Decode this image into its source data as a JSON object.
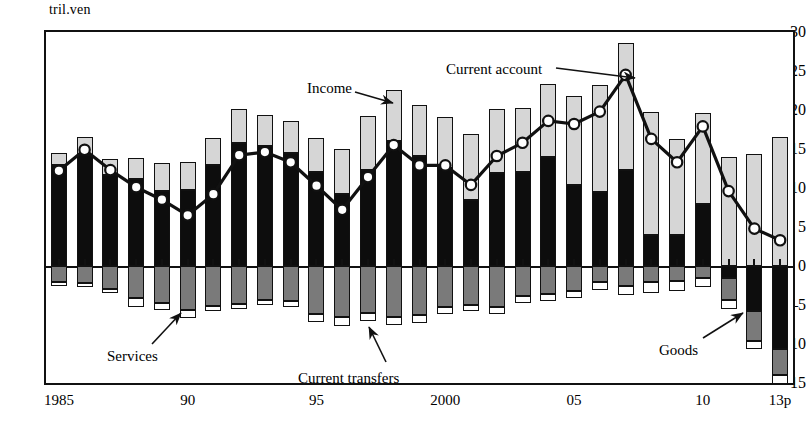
{
  "chart_data": {
    "type": "bar",
    "title": "",
    "subtitle": "",
    "xlabel": "",
    "ylabel": "tril.yen",
    "unit_label": "tril.ven",
    "stacked": true,
    "grid": false,
    "legend_position": "none",
    "ylim": [
      -15,
      30
    ],
    "y_ticks": [
      30,
      25,
      20,
      15,
      10,
      5,
      0,
      -5,
      -10,
      -15
    ],
    "x": [
      1985,
      1986,
      1987,
      1988,
      1989,
      1990,
      1991,
      1992,
      1993,
      1994,
      1995,
      1996,
      1997,
      1998,
      1999,
      2000,
      2001,
      2002,
      2003,
      2004,
      2005,
      2006,
      2007,
      2008,
      2009,
      2010,
      2011,
      2012,
      2013
    ],
    "x_tick_labels": [
      "1985",
      "90",
      "95",
      "2000",
      "05",
      "10",
      "13p"
    ],
    "x_tick_values": [
      1985,
      1990,
      1995,
      2000,
      2005,
      2010,
      2013
    ],
    "series": [
      {
        "name": "Goods",
        "color": "#0d0d0d",
        "values": [
          13.0,
          14.2,
          11.7,
          11.1,
          9.6,
          9.7,
          13.0,
          15.8,
          15.4,
          14.5,
          12.0,
          9.2,
          12.3,
          16.0,
          14.1,
          12.6,
          8.5,
          11.9,
          12.0,
          14.0,
          10.4,
          9.5,
          12.3,
          4.0,
          4.0,
          8.0,
          -1.6,
          -5.8,
          -10.6
        ]
      },
      {
        "name": "Income",
        "color": "#d6d6d6",
        "values": [
          1.5,
          2.4,
          2.0,
          2.7,
          3.6,
          3.6,
          3.4,
          4.3,
          4.0,
          4.1,
          4.4,
          5.8,
          6.9,
          6.6,
          6.5,
          6.5,
          8.4,
          8.2,
          8.3,
          9.3,
          11.4,
          13.7,
          16.3,
          15.8,
          12.3,
          11.6,
          14.0,
          14.3,
          16.5
        ]
      },
      {
        "name": "Services",
        "color": "#7a7a7a",
        "values": [
          -2.1,
          -2.2,
          -3.0,
          -4.1,
          -4.7,
          -5.6,
          -5.1,
          -4.9,
          -4.3,
          -4.5,
          -6.2,
          -6.6,
          -6.0,
          -6.6,
          -6.3,
          -5.3,
          -5.0,
          -5.3,
          -3.9,
          -3.6,
          -3.2,
          -2.1,
          -2.6,
          -2.1,
          -1.9,
          -1.6,
          -2.8,
          -3.8,
          -3.4
        ]
      },
      {
        "name": "Current transfers",
        "color": "#ffffff",
        "values": [
          -0.3,
          -0.3,
          -0.5,
          -1.1,
          -1.0,
          -1.1,
          -0.7,
          -0.6,
          -0.7,
          -0.7,
          -1.0,
          -1.1,
          -1.0,
          -1.0,
          -1.0,
          -0.9,
          -0.8,
          -0.8,
          -0.8,
          -0.9,
          -0.9,
          -1.0,
          -1.1,
          -1.3,
          -1.3,
          -1.1,
          -1.1,
          -1.1,
          -1.1
        ]
      }
    ],
    "line": {
      "name": "Current account",
      "marker": "open-circle",
      "color": "#111111",
      "values": [
        12.2,
        14.9,
        12.3,
        10.1,
        8.5,
        6.5,
        9.2,
        14.2,
        14.6,
        13.3,
        10.3,
        7.2,
        11.4,
        15.5,
        12.9,
        12.9,
        10.4,
        14.1,
        15.8,
        18.6,
        18.2,
        19.8,
        24.5,
        16.3,
        13.3,
        17.9,
        9.6,
        4.8,
        3.3
      ]
    },
    "annotations": [
      {
        "label": "Income",
        "x": 307,
        "y": 80,
        "arrow_from": [
          355,
          92
        ],
        "arrow_to": [
          393,
          103
        ]
      },
      {
        "label": "Current account",
        "x": 446,
        "y": 61,
        "arrow_from": [
          556,
          68
        ],
        "arrow_to": [
          635,
          78
        ]
      },
      {
        "label": "Services",
        "x": 107,
        "y": 348,
        "arrow_from": [
          152,
          344
        ],
        "arrow_to": [
          181,
          313
        ]
      },
      {
        "label": "Current transfers",
        "x": 298,
        "y": 370,
        "arrow_from": [
          386,
          362
        ],
        "arrow_to": [
          369,
          327
        ]
      },
      {
        "label": "Goods",
        "x": 659,
        "y": 342,
        "arrow_from": [
          703,
          338
        ],
        "arrow_to": [
          743,
          313
        ]
      }
    ]
  }
}
